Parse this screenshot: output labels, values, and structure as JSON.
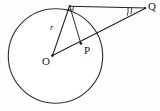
{
  "figure": {
    "background_color": "#fdfdfc",
    "stroke_color": "#2b2723",
    "width": 160,
    "height": 111
  },
  "labels": {
    "center_point": "O",
    "interior_point": "P",
    "external_point": "Q",
    "radius": "r"
  },
  "geometry": {
    "circle": {
      "center_x": 55,
      "center_y": 56,
      "radius": 47
    },
    "points": {
      "A": {
        "x": 70,
        "y": 6
      },
      "O": {
        "x": 53,
        "y": 55
      },
      "P": {
        "x": 81,
        "y": 43
      },
      "Q": {
        "x": 145,
        "y": 8
      }
    },
    "segments": [
      {
        "name": "radius-OA",
        "from": "O",
        "to": "A"
      },
      {
        "name": "tangent-AQ",
        "from": "A",
        "to": "Q"
      },
      {
        "name": "secant-OQ",
        "from": "O",
        "to": "Q"
      },
      {
        "name": "chord-AP",
        "from": "A",
        "to": "P"
      }
    ],
    "markers": {
      "right_angle_at": "A",
      "angle_arc_at": "Q"
    }
  }
}
